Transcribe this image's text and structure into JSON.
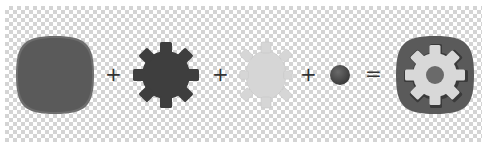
{
  "equation": {
    "operators": [
      "+",
      "+",
      "+",
      "="
    ],
    "parts": [
      {
        "name": "squircle-base",
        "color": "#5a5a5a",
        "edge": "#6e6e6e"
      },
      {
        "name": "dark-gear",
        "color": "#3e3e3e"
      },
      {
        "name": "light-gear",
        "color": "#d6d6d6"
      },
      {
        "name": "center-dot",
        "color": "#4f4f4f"
      },
      {
        "name": "settings-icon-result",
        "base": "#5a5a5a",
        "gear": "#d8d8d8",
        "dot": "#6a6a6a",
        "shadow": "#3a3a3a"
      }
    ]
  }
}
